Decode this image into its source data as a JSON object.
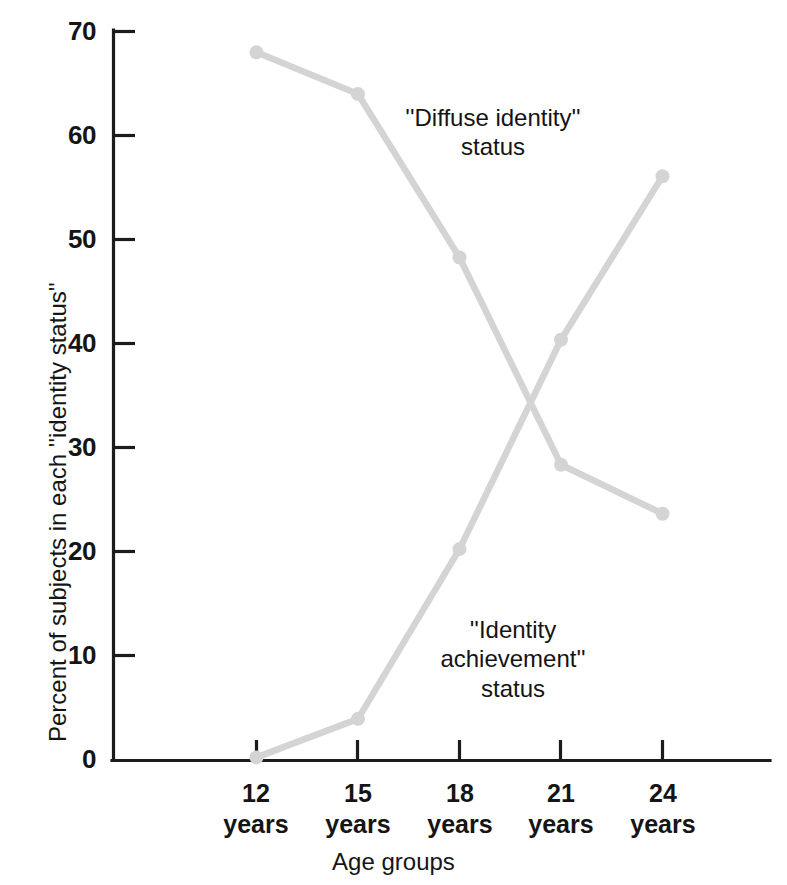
{
  "chart_data": {
    "type": "line",
    "title": "",
    "xlabel": "Age groups",
    "ylabel": "Percent of subjects in each ''identity status''",
    "categories": [
      "12\nyears",
      "15\nyears",
      "18\nyears",
      "21\nyears",
      "24\nyears"
    ],
    "x_values": [
      12,
      15,
      18,
      21,
      24
    ],
    "xlim": [
      12,
      24
    ],
    "ylim": [
      0,
      70
    ],
    "y_ticks": [
      0,
      10,
      20,
      30,
      40,
      50,
      60,
      70
    ],
    "y_tick_labels": [
      "0",
      "10",
      "20",
      "30",
      "40",
      "50",
      "60",
      "70"
    ],
    "grid": false,
    "legend_position": "inline-annotations",
    "series": [
      {
        "name": "''Diffuse identity'' status",
        "color": "#d4d4d4",
        "values": [
          68.0,
          64.0,
          48.3,
          28.4,
          23.7
        ]
      },
      {
        "name": "''Identity achievement'' status",
        "color": "#d4d4d4",
        "values": [
          0.3,
          4.0,
          20.3,
          40.4,
          56.1
        ]
      }
    ],
    "annotations": [
      {
        "id": "diffuse",
        "text": "''Diffuse identity''\nstatus"
      },
      {
        "id": "achievement",
        "text": "''Identity\nachievement''\nstatus"
      }
    ]
  },
  "axes": {
    "y_title": "Percent of subjects in each ''identity status''",
    "x_title": "Age groups",
    "y_labels": [
      "70",
      "60",
      "50",
      "40",
      "30",
      "20",
      "10",
      "0"
    ],
    "x_labels": [
      "12\nyears",
      "15\nyears",
      "18\nyears",
      "21\nyears",
      "24\nyears"
    ]
  },
  "colors": {
    "series": "#d4d4d4",
    "axis": "#1c1c1c",
    "text": "#151515",
    "background": "#ffffff"
  }
}
